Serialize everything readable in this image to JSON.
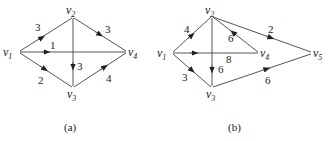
{
  "colors": {
    "edge": "#555555",
    "text": "#222222",
    "background": "#ffffff"
  },
  "graphs": [
    {
      "caption": "(a)",
      "vertices": [
        {
          "id": "v1",
          "base": "v",
          "sub": "1",
          "x": 18,
          "y": 52
        },
        {
          "id": "v2",
          "base": "v",
          "sub": "2",
          "x": 73,
          "y": 17
        },
        {
          "id": "v3",
          "base": "v",
          "sub": "3",
          "x": 73,
          "y": 88
        },
        {
          "id": "v4",
          "base": "v",
          "sub": "4",
          "x": 128,
          "y": 52
        }
      ],
      "edges": [
        {
          "from": "v1",
          "to": "v2",
          "weight": "3"
        },
        {
          "from": "v1",
          "to": "v4",
          "weight": "1"
        },
        {
          "from": "v2",
          "to": "v4",
          "weight": "3"
        },
        {
          "from": "v1",
          "to": "v3",
          "weight": "2"
        },
        {
          "from": "v2",
          "to": "v3",
          "weight": "3"
        },
        {
          "from": "v3",
          "to": "v4",
          "weight": "4"
        }
      ]
    },
    {
      "caption": "(b)",
      "vertices": [
        {
          "id": "v1",
          "base": "v",
          "sub": "1",
          "x": 172,
          "y": 53
        },
        {
          "id": "v2",
          "base": "v",
          "sub": "2",
          "x": 212,
          "y": 17
        },
        {
          "id": "v3",
          "base": "v",
          "sub": "3",
          "x": 212,
          "y": 87
        },
        {
          "id": "v4",
          "base": "v",
          "sub": "4",
          "x": 260,
          "y": 53
        },
        {
          "id": "v5",
          "base": "v",
          "sub": "5",
          "x": 313,
          "y": 53
        }
      ],
      "edges": [
        {
          "from": "v1",
          "to": "v2",
          "weight": "4"
        },
        {
          "from": "v4",
          "to": "v2",
          "weight": "6"
        },
        {
          "from": "v2",
          "to": "v5",
          "weight": "2"
        },
        {
          "from": "v1",
          "to": "v4",
          "weight": "8"
        },
        {
          "from": "v2",
          "to": "v3",
          "weight": "6"
        },
        {
          "from": "v1",
          "to": "v3",
          "weight": "3"
        },
        {
          "from": "v3",
          "to": "v5",
          "weight": "6"
        }
      ]
    }
  ]
}
